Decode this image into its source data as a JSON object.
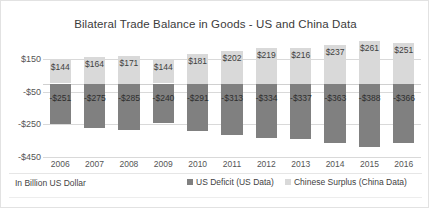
{
  "chart_data": {
    "type": "bar",
    "title": "Bilateral Trade Balance in Goods - US and China Data",
    "subtitle": "In Billion US Dollar",
    "xlabel": "",
    "ylabel": "",
    "ylim": [
      -450,
      150
    ],
    "yticks": [
      150,
      -50,
      -250,
      -450
    ],
    "ytick_labels": [
      "$150",
      "-$50",
      "-$250",
      "-$450"
    ],
    "grid": true,
    "legend_position": "bottom",
    "stacked": true,
    "categories": [
      "2006",
      "2007",
      "2008",
      "2009",
      "2010",
      "2011",
      "2012",
      "2013",
      "2014",
      "2015",
      "2016"
    ],
    "series": [
      {
        "name": "US Deficit (US Data)",
        "color": "#808080",
        "values": [
          -251,
          -275,
          -285,
          -240,
          -291,
          -313,
          -334,
          -337,
          -363,
          -388,
          -366
        ],
        "labels": [
          "-$251",
          "-$275",
          "-$285",
          "-$240",
          "-$291",
          "-$313",
          "-$334",
          "-$337",
          "-$363",
          "-$388",
          "-$366"
        ]
      },
      {
        "name": "Chinese Surplus (China Data)",
        "color": "#d9d9d9",
        "values": [
          144,
          164,
          171,
          144,
          181,
          202,
          219,
          216,
          237,
          261,
          251
        ],
        "labels": [
          "$144",
          "$164",
          "$171",
          "$144",
          "$181",
          "$202",
          "$219",
          "$216",
          "$237",
          "$261",
          "$251"
        ]
      }
    ]
  },
  "chart": {
    "title": "Bilateral Trade Balance in Goods - US and China Data",
    "units_note": "In Billion US Dollar"
  },
  "legend": {
    "items": [
      {
        "label": "US Deficit (US Data)",
        "color": "#808080"
      },
      {
        "label": "Chinese Surplus (China Data)",
        "color": "#d9d9d9"
      }
    ]
  }
}
